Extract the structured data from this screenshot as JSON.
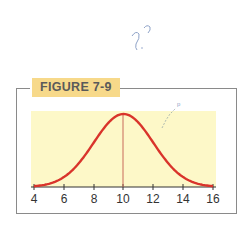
{
  "figure": {
    "label": "FIGURE 7-9",
    "handwritten_note": "?.?",
    "colors": {
      "curve": "#d9342b",
      "plot_bg": "#fdf8c8",
      "tag_bg": "#f7d98a",
      "frame": "#8a8a8a",
      "axis": "#333333"
    }
  },
  "chart_data": {
    "type": "line",
    "title": "FIGURE 7-9",
    "xlabel": "",
    "ylabel": "",
    "x_ticks": [
      4,
      6,
      8,
      10,
      12,
      14,
      16
    ],
    "xlim": [
      4,
      16
    ],
    "mean": 10,
    "std_dev": 2,
    "series": [
      {
        "name": "normal curve",
        "x": [
          4,
          5,
          6,
          7,
          8,
          9,
          10,
          11,
          12,
          13,
          14,
          15,
          16
        ],
        "y": [
          0.011,
          0.044,
          0.135,
          0.325,
          0.607,
          0.882,
          1.0,
          0.882,
          0.607,
          0.325,
          0.135,
          0.044,
          0.011
        ]
      }
    ],
    "annotations": [
      "vertical line at x = 10"
    ],
    "grid": false,
    "legend": null
  }
}
